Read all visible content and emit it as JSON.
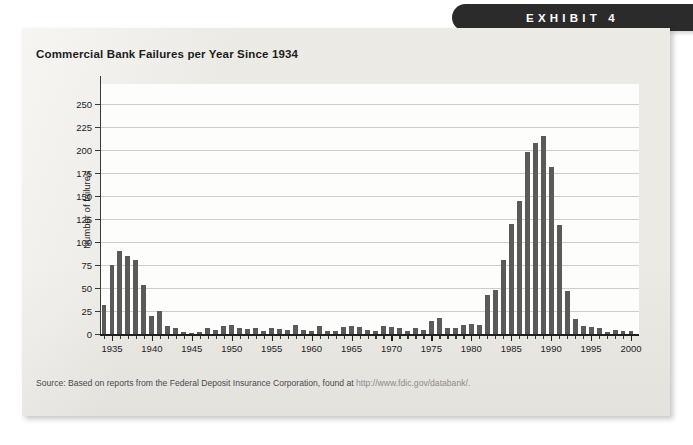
{
  "banner": {
    "label": "EXHIBIT 4"
  },
  "card": {
    "title": "Commercial Bank Failures per Year Since 1934",
    "source_prefix": "Source: Based on reports from the Federal Deposit Insurance Corporation, found at ",
    "source_url": "http://www.fdic.gov/databank/."
  },
  "chart_data": {
    "type": "bar",
    "title": "Commercial Bank Failures per Year Since 1934",
    "xlabel": "",
    "ylabel": "Number of failures",
    "ylim": [
      0,
      250
    ],
    "xlim": [
      1933.5,
      2001
    ],
    "yticks": [
      0,
      25,
      50,
      75,
      100,
      125,
      150,
      175,
      200,
      225,
      250
    ],
    "xticks": [
      1935,
      1940,
      1945,
      1950,
      1955,
      1960,
      1965,
      1970,
      1975,
      1980,
      1985,
      1990,
      1995,
      2000
    ],
    "grid": "horizontal",
    "legend": "none",
    "bar_color": "#5a5a5a",
    "categories": [
      1934,
      1935,
      1936,
      1937,
      1938,
      1939,
      1940,
      1941,
      1942,
      1943,
      1944,
      1945,
      1946,
      1947,
      1948,
      1949,
      1950,
      1951,
      1952,
      1953,
      1954,
      1955,
      1956,
      1957,
      1958,
      1959,
      1960,
      1961,
      1962,
      1963,
      1964,
      1965,
      1966,
      1967,
      1968,
      1969,
      1970,
      1971,
      1972,
      1973,
      1974,
      1975,
      1976,
      1977,
      1978,
      1979,
      1980,
      1981,
      1982,
      1983,
      1984,
      1985,
      1986,
      1987,
      1988,
      1989,
      1990,
      1991,
      1992,
      1993,
      1994,
      1995,
      1996,
      1997,
      1998,
      1999,
      2000
    ],
    "values": [
      32,
      75,
      90,
      85,
      80,
      53,
      20,
      25,
      9,
      6,
      2,
      1,
      2,
      6,
      4,
      9,
      10,
      7,
      5,
      6,
      3,
      6,
      5,
      4,
      10,
      4,
      3,
      9,
      3,
      3,
      8,
      9,
      8,
      4,
      3,
      9,
      8,
      7,
      3,
      6,
      4,
      14,
      17,
      6,
      7,
      10,
      11,
      10,
      42,
      48,
      80,
      120,
      145,
      198,
      208,
      215,
      182,
      119,
      47,
      16,
      9,
      8,
      6,
      2,
      4,
      3,
      3
    ]
  }
}
